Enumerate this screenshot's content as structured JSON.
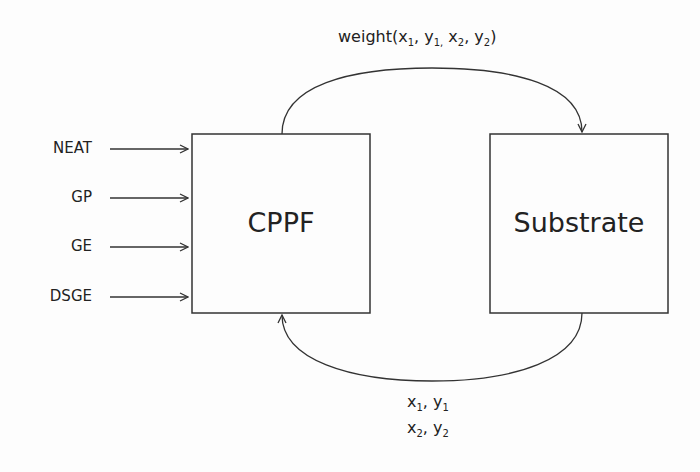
{
  "inputs": [
    {
      "label": "NEAT"
    },
    {
      "label": "GP"
    },
    {
      "label": "GE"
    },
    {
      "label": "DSGE"
    }
  ],
  "boxes": {
    "cppf": {
      "label": "CPPF"
    },
    "substrate": {
      "label": "Substrate"
    }
  },
  "top_arrow": {
    "prefix": "weight(",
    "parts": [
      {
        "var": "x",
        "sub": "1",
        "sep": ", "
      },
      {
        "var": "y",
        "sub": "1,",
        "sep": " "
      },
      {
        "var": "x",
        "sub": "2",
        "sep": ", "
      },
      {
        "var": "y",
        "sub": "2",
        "sep": ""
      }
    ],
    "suffix": ")"
  },
  "bottom_arrow": {
    "line1": [
      {
        "var": "x",
        "sub": "1",
        "sep": ", "
      },
      {
        "var": "y",
        "sub": "1",
        "sep": ""
      }
    ],
    "line2": [
      {
        "var": "x",
        "sub": "2",
        "sep": ", "
      },
      {
        "var": "y",
        "sub": "2",
        "sep": ""
      }
    ]
  },
  "colors": {
    "stroke": "#333333",
    "background": "#fdfdfd"
  }
}
